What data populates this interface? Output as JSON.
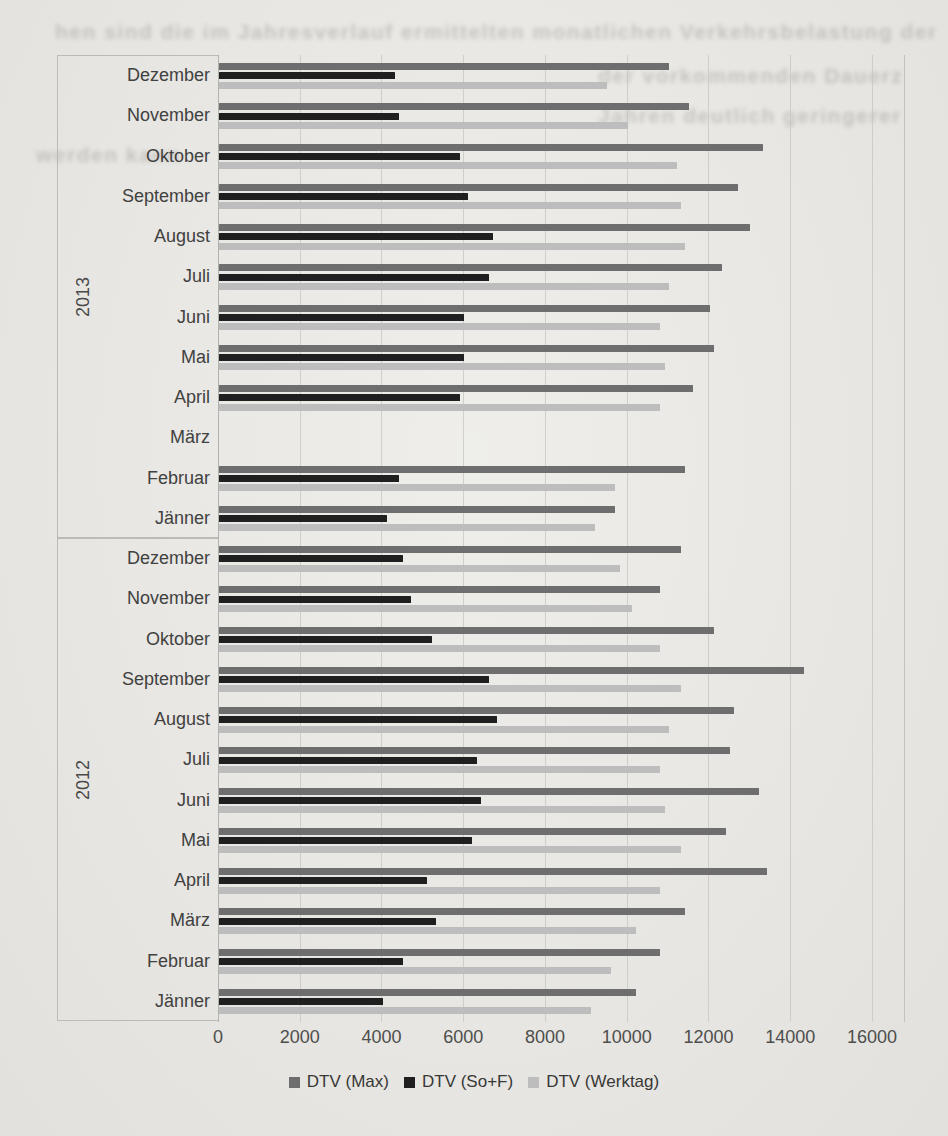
{
  "page": {
    "background_color": "#e9e8e4",
    "kind": "scanned document page with embedded chart"
  },
  "bleedthrough": {
    "note": "illegible mirrored text showing through from reverse of scanned page",
    "color": "#8a8a86",
    "lines": [
      {
        "text": "hen sind die im Jahresverlauf ermittelten monatlichen Verkehrsbelastung der",
        "x": 55,
        "y": 20
      },
      {
        "text": "der vorkommenden Dauerz",
        "x": 598,
        "y": 64
      },
      {
        "text": "Jahren deutlich geringerer",
        "x": 598,
        "y": 104
      },
      {
        "text": "werden kann",
        "x": 36,
        "y": 143
      }
    ]
  },
  "chart_data": {
    "type": "bar",
    "orientation": "horizontal",
    "title": "",
    "xlabel": "",
    "ylabel": "",
    "grid": true,
    "legend_position": "bottom",
    "x_axis": {
      "min": 0,
      "max": 16000,
      "tick_step": 2000,
      "tick_labels": [
        "0",
        "2000",
        "4000",
        "6000",
        "8000",
        "10000",
        "12000",
        "14000",
        "16000"
      ]
    },
    "series": [
      {
        "key": "max",
        "name": "DTV (Max)",
        "color": "#6e6e6e"
      },
      {
        "key": "sof",
        "name": "DTV (So+F)",
        "color": "#1f1f1f"
      },
      {
        "key": "werktag",
        "name": "DTV (Werktag)",
        "color": "#bdbdbd"
      }
    ],
    "groups": [
      {
        "year": "2013",
        "rows": [
          {
            "month": "Dezember",
            "max": 11000,
            "sof": 4300,
            "werktag": 9500
          },
          {
            "month": "November",
            "max": 11500,
            "sof": 4400,
            "werktag": 10000
          },
          {
            "month": "Oktober",
            "max": 13300,
            "sof": 5900,
            "werktag": 11200
          },
          {
            "month": "September",
            "max": 12700,
            "sof": 6100,
            "werktag": 11300
          },
          {
            "month": "August",
            "max": 13000,
            "sof": 6700,
            "werktag": 11400
          },
          {
            "month": "Juli",
            "max": 12300,
            "sof": 6600,
            "werktag": 11000
          },
          {
            "month": "Juni",
            "max": 12000,
            "sof": 6000,
            "werktag": 10800
          },
          {
            "month": "Mai",
            "max": 12100,
            "sof": 6000,
            "werktag": 10900
          },
          {
            "month": "April",
            "max": 11600,
            "sof": 5900,
            "werktag": 10800
          },
          {
            "month": "März",
            "max": null,
            "sof": null,
            "werktag": null
          },
          {
            "month": "Februar",
            "max": 11400,
            "sof": 4400,
            "werktag": 9700
          },
          {
            "month": "Jänner",
            "max": 9700,
            "sof": 4100,
            "werktag": 9200
          }
        ]
      },
      {
        "year": "2012",
        "rows": [
          {
            "month": "Dezember",
            "max": 11300,
            "sof": 4500,
            "werktag": 9800
          },
          {
            "month": "November",
            "max": 10800,
            "sof": 4700,
            "werktag": 10100
          },
          {
            "month": "Oktober",
            "max": 12100,
            "sof": 5200,
            "werktag": 10800
          },
          {
            "month": "September",
            "max": 14300,
            "sof": 6600,
            "werktag": 11300
          },
          {
            "month": "August",
            "max": 12600,
            "sof": 6800,
            "werktag": 11000
          },
          {
            "month": "Juli",
            "max": 12500,
            "sof": 6300,
            "werktag": 10800
          },
          {
            "month": "Juni",
            "max": 13200,
            "sof": 6400,
            "werktag": 10900
          },
          {
            "month": "Mai",
            "max": 12400,
            "sof": 6200,
            "werktag": 11300
          },
          {
            "month": "April",
            "max": 13400,
            "sof": 5100,
            "werktag": 10800
          },
          {
            "month": "März",
            "max": 11400,
            "sof": 5300,
            "werktag": 10200
          },
          {
            "month": "Februar",
            "max": 10800,
            "sof": 4500,
            "werktag": 9600
          },
          {
            "month": "Jänner",
            "max": 10200,
            "sof": 4000,
            "werktag": 9100
          }
        ]
      }
    ]
  }
}
